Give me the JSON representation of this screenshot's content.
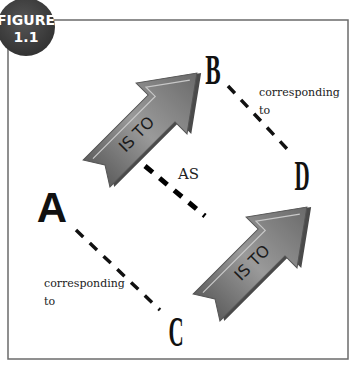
{
  "figure": {
    "badge_line1": "FIGURE",
    "badge_line2": "1.1",
    "badge_color": "#3d3d3d"
  },
  "nodes": {
    "a": "A",
    "b": "B",
    "c": "C",
    "d": "D"
  },
  "arrows": {
    "top_label": "IS TO",
    "bottom_label": "IS TO",
    "fill_color": "#7d7d7d"
  },
  "labels": {
    "as": "AS",
    "corr_top_line1": "corresponding",
    "corr_top_line2": "to",
    "corr_bottom_line1": "corresponding",
    "corr_bottom_line2": "to"
  }
}
